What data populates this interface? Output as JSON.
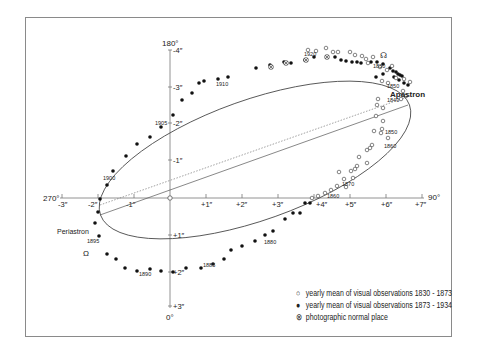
{
  "diagram": {
    "position_angle_labels": {
      "top": "180°",
      "bottom": "0°",
      "left": "270°",
      "right": "90°"
    },
    "x_axis_ticks": [
      "-3″",
      "-2″",
      "-1″",
      "+1″",
      "+2″",
      "+3″",
      "+4″",
      "+5″",
      "+6″",
      "+7″"
    ],
    "y_axis_ticks": [
      "-4″",
      "-3″",
      "-2″",
      "-1″",
      "+1″",
      "+2″",
      "+3″"
    ],
    "annotations": {
      "periastron": "Periastron",
      "apastron": "Apastron",
      "ascending_node": "☊",
      "descending_node": "Ω"
    },
    "epoch_labels": [
      {
        "text": "1830",
        "x": 396,
        "y": 77
      },
      {
        "text": "1840",
        "x": 384,
        "y": 100
      },
      {
        "text": "1850",
        "x": 386,
        "y": 87
      },
      {
        "text": "1850",
        "x": 385,
        "y": 131
      },
      {
        "text": "1860",
        "x": 375,
        "y": 145
      },
      {
        "text": "1870",
        "x": 340,
        "y": 184
      },
      {
        "text": "1860",
        "x": 327,
        "y": 198
      },
      {
        "text": "1880",
        "x": 263,
        "y": 243
      },
      {
        "text": "1885",
        "x": 204,
        "y": 265
      },
      {
        "text": "1890",
        "x": 138,
        "y": 274
      },
      {
        "text": "1895",
        "x": 87,
        "y": 241
      },
      {
        "text": "1900",
        "x": 102,
        "y": 178
      },
      {
        "text": "1905",
        "x": 155,
        "y": 122
      },
      {
        "text": "1910",
        "x": 217,
        "y": 83
      },
      {
        "text": "1920",
        "x": 303,
        "y": 54
      }
    ],
    "legend": [
      {
        "symbol": "○",
        "label": "yearly mean of visual observations 1830 - 1873"
      },
      {
        "symbol": "●",
        "label": "yearly mean of visual observations 1873 - 1934"
      },
      {
        "symbol": "⊗",
        "label": "photographic normal place"
      }
    ]
  }
}
